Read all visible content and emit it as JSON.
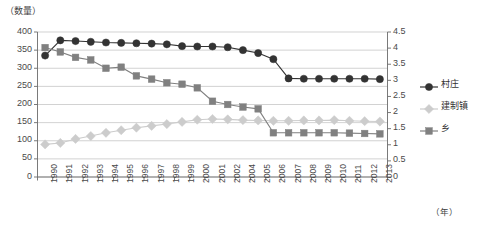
{
  "chart_data": {
    "type": "line",
    "title": "",
    "ylabel": "（数量）",
    "xlabel": "（年）",
    "grid": true,
    "legend_position": "right",
    "ylim": [
      0,
      400
    ],
    "y2lim": [
      0,
      4.5
    ],
    "categories": [
      "1990",
      "1991",
      "1992",
      "1993",
      "1994",
      "1995",
      "1996",
      "1997",
      "1998",
      "1999",
      "2000",
      "2001",
      "2002",
      "2004",
      "2005",
      "2006",
      "2007",
      "2008",
      "2009",
      "2010",
      "2011",
      "2012",
      "2013"
    ],
    "y_ticks": [
      "0",
      "50",
      "100",
      "150",
      "200",
      "250",
      "300",
      "350",
      "400"
    ],
    "y2_ticks": [
      "0",
      "0.5",
      "1",
      "1.5",
      "2",
      "2.5",
      "3",
      "3.5",
      "4",
      "4.5"
    ],
    "series": [
      {
        "name": "村庄",
        "marker": "circle",
        "color": "#333333",
        "values": [
          335,
          377,
          375,
          373,
          371,
          370,
          369,
          368,
          366,
          361,
          360,
          360,
          358,
          350,
          342,
          325,
          272,
          271,
          271,
          271,
          271,
          271,
          270
        ]
      },
      {
        "name": "建制镇",
        "marker": "diamond",
        "color": "#cccccc",
        "values": [
          90,
          94,
          105,
          113,
          122,
          129,
          136,
          141,
          146,
          152,
          158,
          160,
          159,
          157,
          156,
          155,
          155,
          156,
          156,
          157,
          155,
          154,
          153
        ]
      },
      {
        "name": "乡",
        "marker": "square",
        "color": "#808080",
        "values": [
          357,
          345,
          330,
          323,
          300,
          303,
          279,
          270,
          260,
          256,
          246,
          209,
          200,
          193,
          188,
          122,
          122,
          122,
          122,
          122,
          121,
          120,
          119
        ]
      }
    ]
  },
  "legend": {
    "items": [
      {
        "label": "村庄"
      },
      {
        "label": "建制镇"
      },
      {
        "label": "乡"
      }
    ]
  }
}
